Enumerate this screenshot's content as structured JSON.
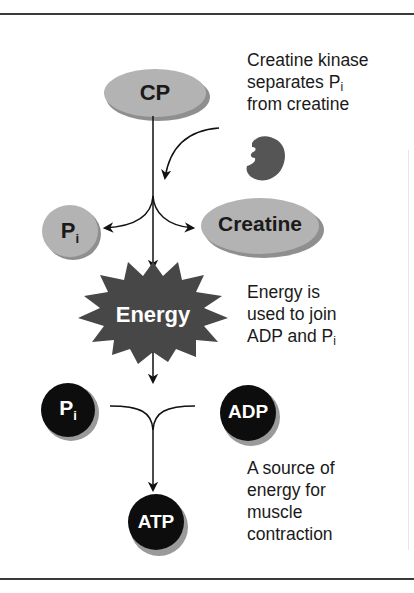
{
  "diagram": {
    "nodes": {
      "cp": "CP",
      "pi_top": {
        "base": "P",
        "sub": "i"
      },
      "creatine": "Creatine",
      "energy": "Energy",
      "pi_bottom": {
        "base": "P",
        "sub": "i"
      },
      "adp": "ADP",
      "atp": "ATP"
    },
    "annotations": {
      "enzyme": {
        "line1": "Creatine kinase",
        "line2": "separates P",
        "line2_sub": "i",
        "line3": "from creatine"
      },
      "energy_use": {
        "line1": "Energy is",
        "line2": "used to join",
        "line3": "ADP and P",
        "line3_sub": "i"
      },
      "atp_use": {
        "line1": "A source of",
        "line2": "energy for",
        "line3": "muscle",
        "line4": "contraction"
      }
    },
    "colors": {
      "light_node": "#b3b3b3",
      "light_node_shadow": "#8f8f8f",
      "dark_node": "#0d0d0d",
      "dark_node_shadow": "#9a9a9a",
      "burst": "#474747",
      "enzyme": "#555555",
      "arrow": "#111111"
    }
  }
}
